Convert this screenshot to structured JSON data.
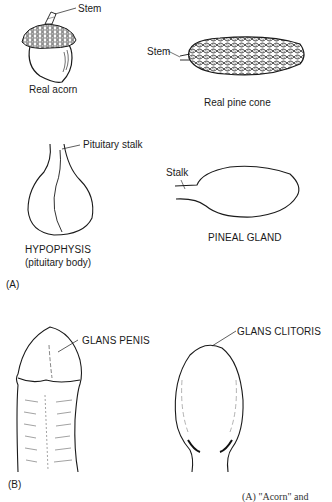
{
  "panel_a": {
    "marker": "(A)",
    "acorn": {
      "stem_label": "Stem",
      "title": "Real acorn"
    },
    "pine_cone": {
      "stem_label": "Stem",
      "title": "Real pine cone"
    },
    "hypophysis": {
      "stalk_label": "Pituitary stalk",
      "title": "HYPOPHYSIS",
      "subtitle": "(pituitary body)"
    },
    "pineal": {
      "stalk_label": "Stalk",
      "title": "PINEAL GLAND"
    }
  },
  "panel_b": {
    "marker": "(B)",
    "penis": {
      "label": "GLANS PENIS"
    },
    "clitoris": {
      "label": "GLANS CLITORIS"
    }
  },
  "caption_partial": "(A) \"Acorn\" and"
}
